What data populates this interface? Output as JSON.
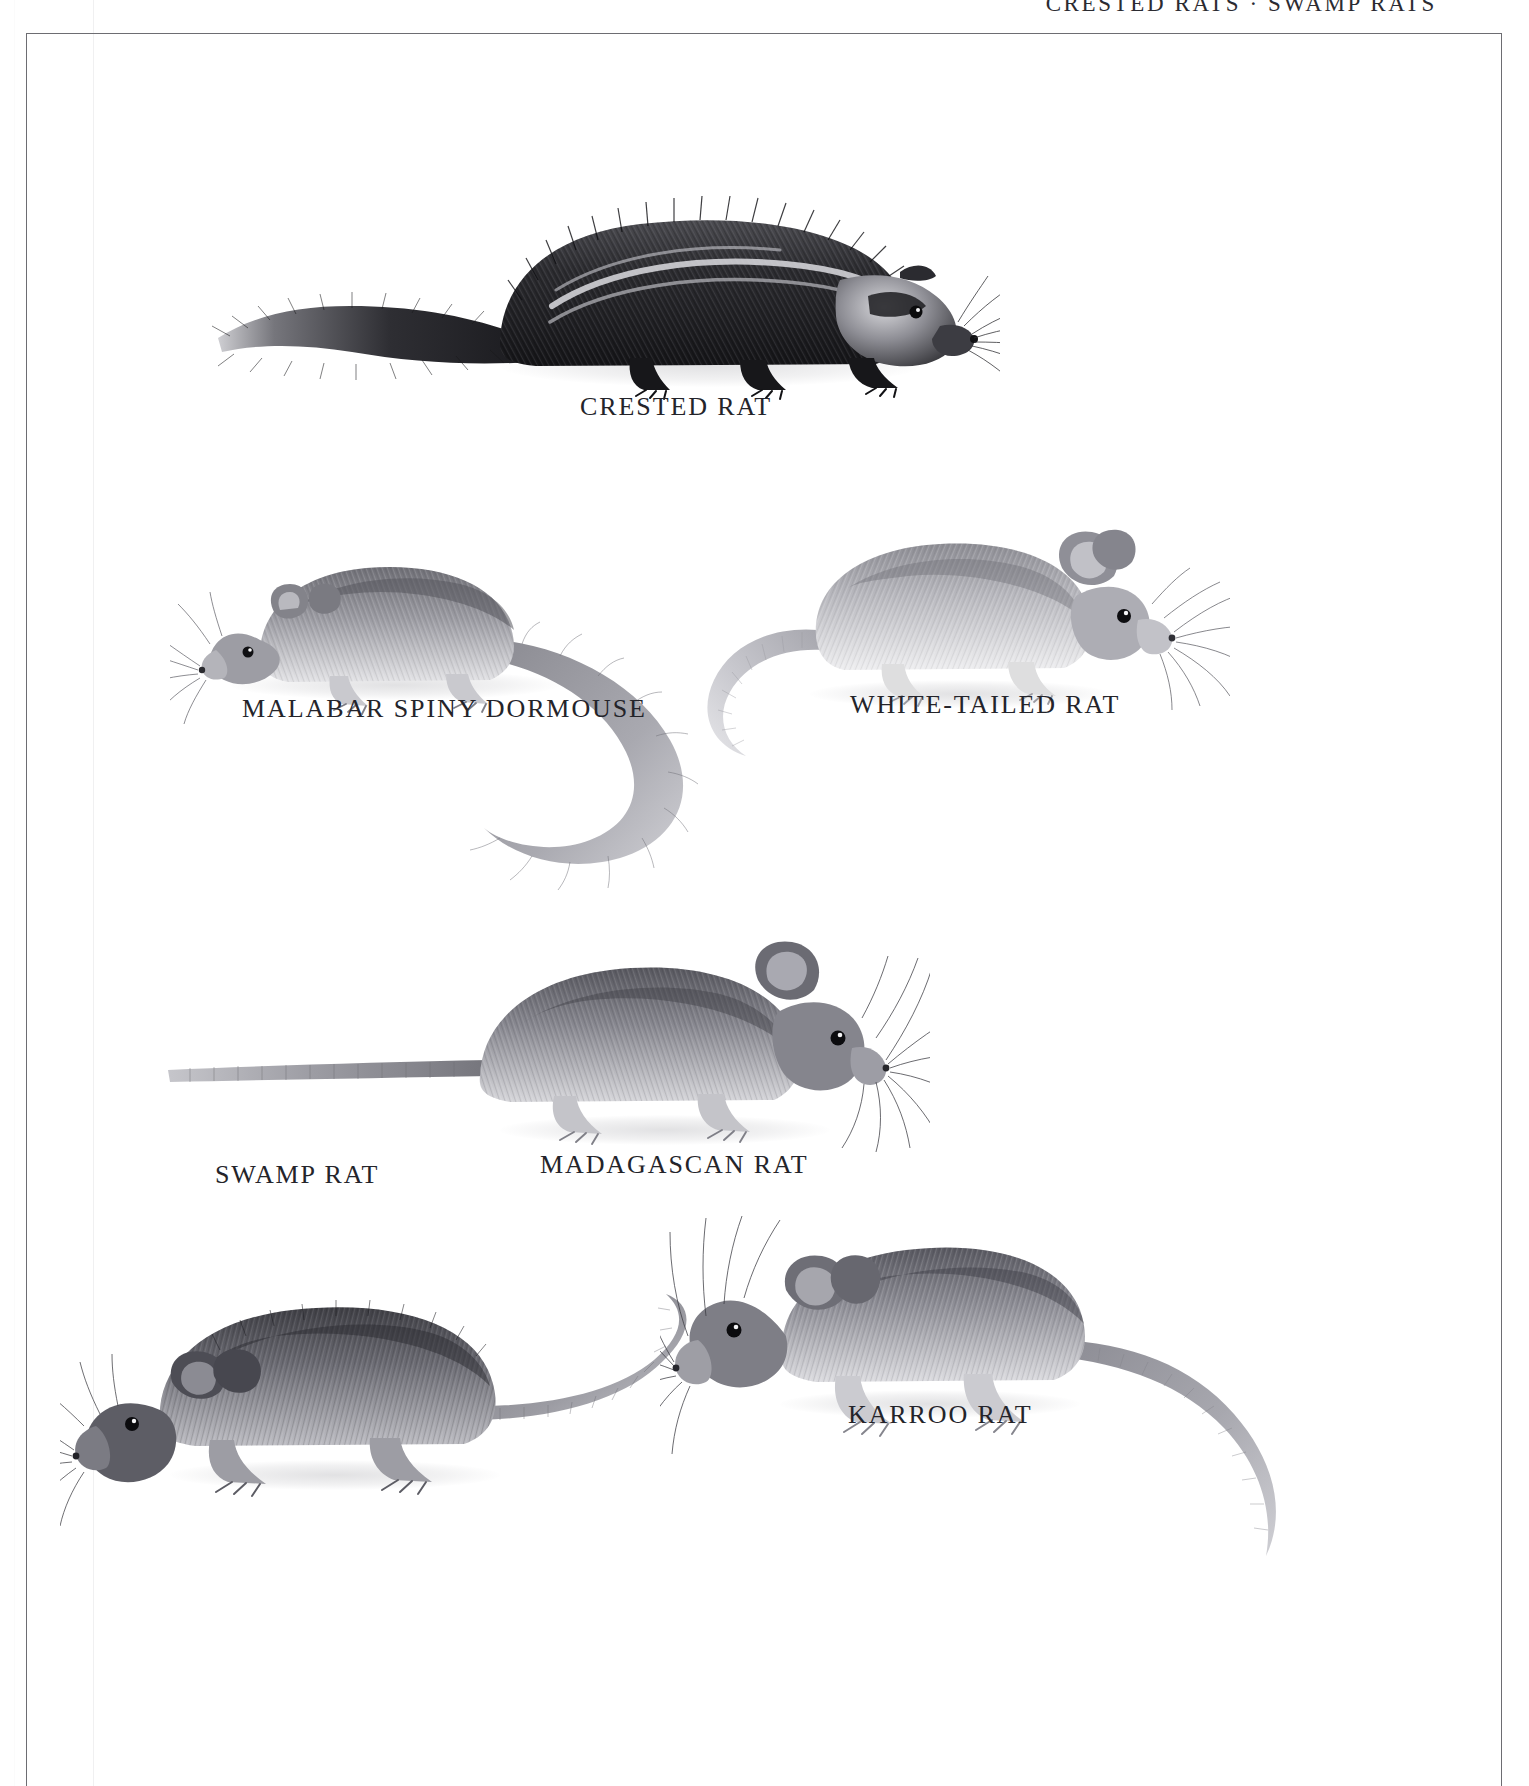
{
  "page": {
    "running_head": "CRESTED RATS · SWAMP RATS",
    "background_color": "#ffffff",
    "frame_color": "#6d6d72",
    "caption_color": "#24242a"
  },
  "plate": {
    "figures": [
      {
        "id": "crested-rat",
        "caption": "CRESTED RAT",
        "tone": "dark",
        "description": "Large shaggy dark rat with pale lateral crest stripe and long bushy tail, facing right"
      },
      {
        "id": "malabar-spiny-dormouse",
        "caption": "MALABAR SPINY DORMOUSE",
        "tone": "mid-grey",
        "description": "Grey dormouse facing left with very long curved bushy-tipped tail sweeping down and right"
      },
      {
        "id": "white-tailed-rat",
        "caption": "WHITE-TAILED RAT",
        "tone": "light-grey",
        "description": "Pale stocky rat facing right with large rounded ears and long pale naked tail curving left"
      },
      {
        "id": "madagascan-rat",
        "caption": "MADAGASCAN RAT",
        "tone": "mid-dark-grey",
        "description": "Grey-brown rat facing right with long straight tail extending far to the left and long whiskers"
      },
      {
        "id": "swamp-rat",
        "caption": "SWAMP RAT",
        "tone": "dark-grey",
        "description": "Robust dark rat facing left with short rounded ears and a long tapering tail curving right"
      },
      {
        "id": "karroo-rat",
        "caption": "KARROO RAT",
        "tone": "mid-grey",
        "description": "Grey rat facing left with head raised, long whiskers and a very long tail curving down to the right"
      }
    ]
  }
}
